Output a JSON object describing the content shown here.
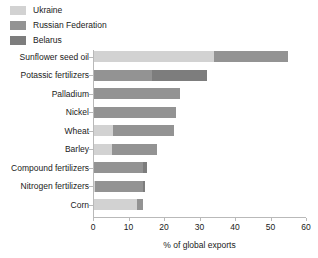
{
  "chart_data": {
    "type": "bar",
    "orientation": "horizontal",
    "stacked": true,
    "title": "",
    "xlabel": "% of global exports",
    "ylabel": "",
    "xlim": [
      0,
      60
    ],
    "xticks": [
      0,
      10,
      20,
      30,
      40,
      50,
      60
    ],
    "xtick_labels": [
      "0",
      "10",
      "20",
      "30",
      "40",
      "50",
      "60"
    ],
    "grid": false,
    "legend_position": "top-left",
    "categories": [
      "Sunflower seed oil",
      "Potassic fertilizers",
      "Palladium",
      "Nickel",
      "Wheat",
      "Barley",
      "Compound fertilizers",
      "Nitrogen fertilizers",
      "Corn"
    ],
    "series": [
      {
        "name": "Ukraine",
        "color": "#d2d2d2",
        "values": [
          34.0,
          0.0,
          0.0,
          0.0,
          5.7,
          5.4,
          0.0,
          0.6,
          12.5
        ]
      },
      {
        "name": "Russian Federation",
        "color": "#939393",
        "values": [
          21.0,
          16.5,
          24.5,
          23.5,
          17.2,
          12.7,
          14.0,
          13.5,
          1.6
        ]
      },
      {
        "name": "Belarus",
        "color": "#7d7d7d",
        "values": [
          0.0,
          15.5,
          0.0,
          0.0,
          0.0,
          0.0,
          1.2,
          0.5,
          0.0
        ]
      }
    ],
    "totals": [
      55.0,
      32.0,
      24.5,
      23.5,
      22.9,
      18.1,
      15.2,
      14.6,
      14.1
    ]
  },
  "legend": {
    "items": [
      {
        "label": "Ukraine",
        "color": "#d2d2d2"
      },
      {
        "label": "Russian Federation",
        "color": "#939393"
      },
      {
        "label": "Belarus",
        "color": "#7d7d7d"
      }
    ]
  },
  "axis": {
    "x_title": "% of global exports"
  }
}
